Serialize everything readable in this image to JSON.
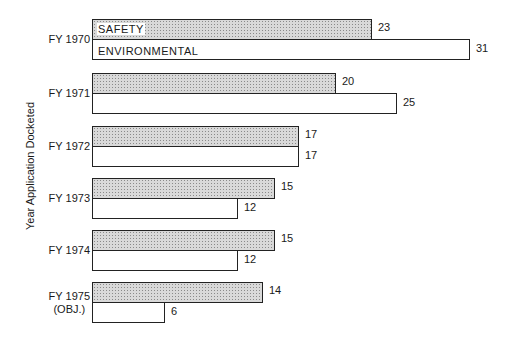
{
  "chart_data": {
    "type": "bar",
    "orientation": "horizontal",
    "title": "",
    "xlabel": "",
    "ylabel": "Year Application Docketed",
    "categories": [
      "FY 1970",
      "FY 1971",
      "FY 1972",
      "FY 1973",
      "FY 1974",
      "FY 1975 (OBJ.)"
    ],
    "series": [
      {
        "name": "SAFETY",
        "pattern": "stippled",
        "values": [
          23,
          20,
          17,
          15,
          15,
          14
        ]
      },
      {
        "name": "ENVIRONMENTAL",
        "pattern": "white",
        "values": [
          31,
          25,
          17,
          12,
          12,
          6
        ]
      }
    ],
    "legend": "inline labels inside first bars",
    "grid": false,
    "xlim": [
      0,
      31
    ]
  },
  "labels": {
    "ylabel": "Year Application Docketed",
    "cat": [
      "FY 1970",
      "FY 1971",
      "FY 1972",
      "FY 1973",
      "FY 1974",
      "FY 1975"
    ],
    "cat_sub": {
      "5": "(OBJ.)"
    },
    "safety_legend": "SAFETY",
    "env_legend": "ENVIRONMENTAL"
  },
  "colors": {
    "safety_fill": "#d9d9d9",
    "env_fill": "#ffffff",
    "stroke": "#222222"
  }
}
